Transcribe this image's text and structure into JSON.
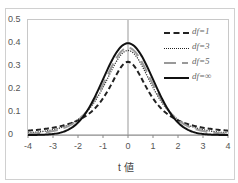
{
  "chart_data": {
    "type": "line",
    "title": "",
    "xlabel": "t 値",
    "ylabel": "",
    "xlim": [
      -4,
      4
    ],
    "ylim": [
      0,
      0.5
    ],
    "x_ticks": [
      "-4",
      "-3",
      "-2",
      "-1",
      "0",
      "1",
      "2",
      "3",
      "4"
    ],
    "y_ticks": [
      "0",
      "0.1",
      "0.2",
      "0.3",
      "0.4",
      "0.5"
    ],
    "grid": false,
    "legend_position": "upper right",
    "x": [
      -4,
      -3.5,
      -3,
      -2.5,
      -2,
      -1.5,
      -1,
      -0.5,
      0,
      0.5,
      1,
      1.5,
      2,
      2.5,
      3,
      3.5,
      4
    ],
    "series": [
      {
        "name": "df=1",
        "style": "dashed",
        "values": [
          0.019,
          0.024,
          0.032,
          0.044,
          0.064,
          0.098,
          0.159,
          0.255,
          0.318,
          0.255,
          0.159,
          0.098,
          0.064,
          0.044,
          0.032,
          0.024,
          0.019
        ]
      },
      {
        "name": "df=3",
        "style": "dotted",
        "values": [
          0.009,
          0.014,
          0.023,
          0.038,
          0.068,
          0.127,
          0.207,
          0.313,
          0.368,
          0.313,
          0.207,
          0.127,
          0.068,
          0.038,
          0.023,
          0.014,
          0.009
        ]
      },
      {
        "name": "df=5",
        "style": "long-dash gray",
        "values": [
          0.005,
          0.009,
          0.017,
          0.034,
          0.065,
          0.125,
          0.22,
          0.33,
          0.38,
          0.33,
          0.22,
          0.125,
          0.065,
          0.034,
          0.017,
          0.009,
          0.005
        ]
      },
      {
        "name": "df=∞",
        "style": "solid",
        "values": [
          0.0001,
          0.0009,
          0.004,
          0.018,
          0.054,
          0.13,
          0.242,
          0.352,
          0.399,
          0.352,
          0.242,
          0.13,
          0.054,
          0.018,
          0.004,
          0.0009,
          0.0001
        ]
      }
    ]
  },
  "legend": [
    {
      "label": "df=1"
    },
    {
      "label": "df=3"
    },
    {
      "label": "df=5"
    },
    {
      "label": "df=∞"
    }
  ]
}
